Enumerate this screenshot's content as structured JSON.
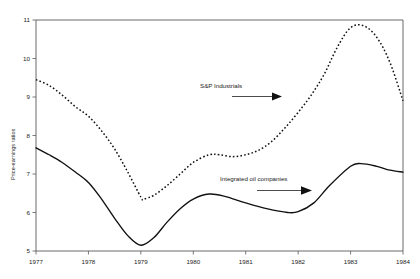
{
  "chart_data": {
    "type": "line",
    "title": "",
    "xlabel": "",
    "ylabel": "Price-earnings ratios",
    "xlim": [
      1977,
      1984
    ],
    "ylim": [
      5,
      11
    ],
    "xticks": [
      "1977",
      "1978",
      "1979",
      "1980",
      "1981",
      "1982",
      "1983",
      "1984"
    ],
    "yticks": [
      "5",
      "6",
      "7",
      "8",
      "9",
      "10",
      "11"
    ],
    "grid": false,
    "legend_position": "inline-annotations",
    "series": [
      {
        "name": "S&P Industrials",
        "style": "dotted",
        "x": [
          1977,
          1977.25,
          1977.5,
          1977.75,
          1978,
          1978.25,
          1978.5,
          1978.75,
          1979,
          1979.05,
          1979.25,
          1979.5,
          1979.75,
          1980,
          1980.3,
          1980.5,
          1980.75,
          1981,
          1981.25,
          1981.5,
          1981.75,
          1982,
          1982.25,
          1982.5,
          1982.75,
          1983,
          1983.25,
          1983.5,
          1983.75,
          1984
        ],
        "values": [
          9.45,
          9.3,
          9.05,
          8.75,
          8.5,
          8.12,
          7.65,
          7.05,
          6.4,
          6.35,
          6.45,
          6.7,
          7.0,
          7.3,
          7.5,
          7.5,
          7.45,
          7.5,
          7.62,
          7.85,
          8.2,
          8.6,
          9.05,
          9.6,
          10.3,
          10.8,
          10.85,
          10.55,
          9.9,
          8.9
        ]
      },
      {
        "name": "Integrated oil companies",
        "style": "solid",
        "x": [
          1977,
          1977.25,
          1977.5,
          1977.75,
          1978,
          1978.25,
          1978.5,
          1978.75,
          1979,
          1979.25,
          1979.5,
          1979.75,
          1980,
          1980.3,
          1980.6,
          1981,
          1981.4,
          1981.8,
          1982,
          1982.3,
          1982.6,
          1983,
          1983.2,
          1983.5,
          1983.75,
          1984
        ],
        "values": [
          7.68,
          7.5,
          7.3,
          7.05,
          6.78,
          6.35,
          5.85,
          5.4,
          5.15,
          5.35,
          5.75,
          6.1,
          6.35,
          6.48,
          6.42,
          6.25,
          6.1,
          6.0,
          6.02,
          6.25,
          6.7,
          7.2,
          7.27,
          7.2,
          7.1,
          7.05
        ]
      }
    ],
    "annotations": [
      {
        "text": "S&P Industrials",
        "arrow": "right",
        "points_to_series": "S&P Industrials"
      },
      {
        "text": "Integrated oil companies",
        "arrow": "right",
        "points_to_series": "Integrated oil companies"
      }
    ]
  }
}
